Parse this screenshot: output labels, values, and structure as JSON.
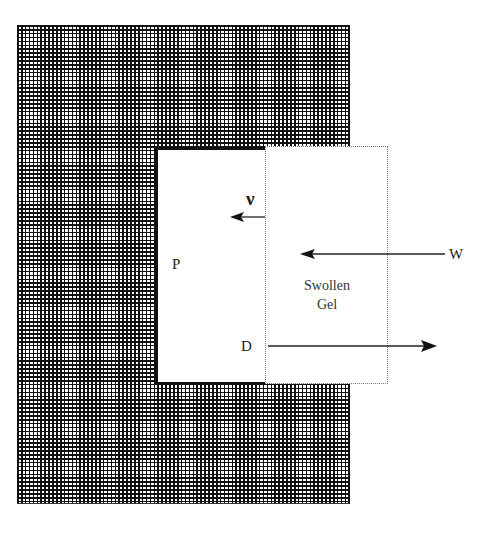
{
  "diagram": {
    "labels": {
      "nu": "ν",
      "w": "W",
      "p": "P",
      "gel_line1": "Swollen",
      "gel_line2": "Gel",
      "d": "D"
    },
    "regions": [
      {
        "id": "matrix",
        "style": "cross-hatched",
        "color": "#111111"
      },
      {
        "id": "core",
        "label": "P",
        "style": "white, solid border"
      },
      {
        "id": "swollen-gel",
        "label": "Swollen Gel",
        "style": "white, dotted border"
      }
    ],
    "arrows": [
      {
        "id": "nu-arrow",
        "label": "ν",
        "direction": "left"
      },
      {
        "id": "w-arrow",
        "label": "W",
        "direction": "left"
      },
      {
        "id": "d-arrow",
        "label": "D",
        "direction": "right"
      }
    ],
    "colors": {
      "ink": "#111111",
      "dotted_border": "#777777",
      "background": "#ffffff"
    }
  }
}
